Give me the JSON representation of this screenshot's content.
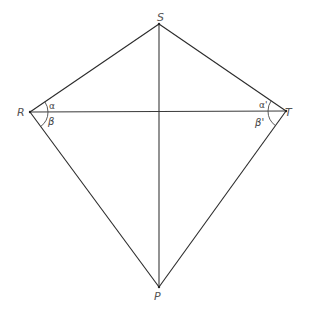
{
  "diagram": {
    "type": "kite",
    "vertices": {
      "S": {
        "label": "S",
        "x": 159,
        "y": 24
      },
      "R": {
        "label": "R",
        "x": 30,
        "y": 112
      },
      "T": {
        "label": "T",
        "x": 286,
        "y": 111
      },
      "P": {
        "label": "P",
        "x": 159,
        "y": 287
      }
    },
    "edges": [
      [
        "R",
        "S"
      ],
      [
        "S",
        "T"
      ],
      [
        "T",
        "P"
      ],
      [
        "P",
        "R"
      ]
    ],
    "diagonals": [
      [
        "R",
        "T"
      ],
      [
        "S",
        "P"
      ]
    ],
    "angles": {
      "alpha": "α",
      "beta": "β",
      "alpha_prime": "α'",
      "beta_prime": "β'"
    },
    "colors": {
      "stroke": "#2a2a2a",
      "label": "#555555",
      "background": "#ffffff"
    }
  }
}
